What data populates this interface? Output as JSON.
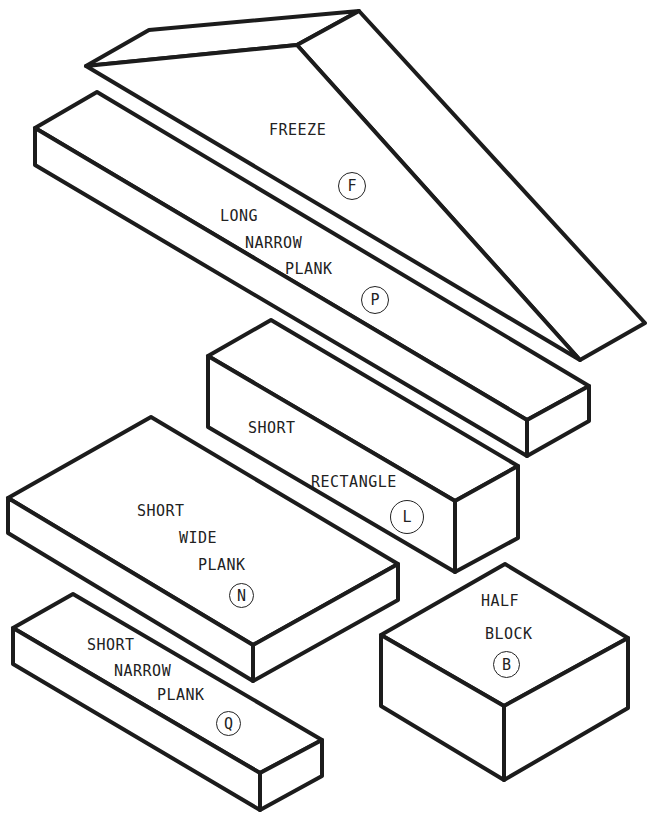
{
  "diagram": {
    "line_color": "#1c1c1c",
    "blocks": [
      {
        "id": "freeze",
        "label_lines": [
          "FREEZE"
        ],
        "code": "F"
      },
      {
        "id": "long-narrow-plank",
        "label_lines": [
          "LONG",
          "NARROW",
          "PLANK"
        ],
        "code": "P"
      },
      {
        "id": "short-rectangle",
        "label_lines": [
          "SHORT",
          "RECTANGLE"
        ],
        "code": "L"
      },
      {
        "id": "short-wide-plank",
        "label_lines": [
          "SHORT",
          "WIDE",
          "PLANK"
        ],
        "code": "N"
      },
      {
        "id": "half-block",
        "label_lines": [
          "HALF",
          "BLOCK"
        ],
        "code": "B"
      },
      {
        "id": "short-narrow-plank",
        "label_lines": [
          "SHORT",
          "NARROW",
          "PLANK"
        ],
        "code": "Q"
      }
    ]
  }
}
